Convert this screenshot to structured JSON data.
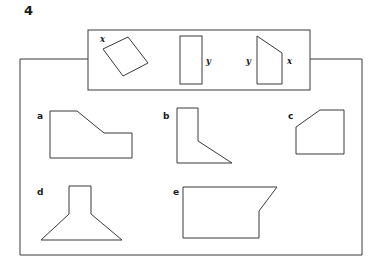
{
  "question": {
    "number": "4"
  },
  "prompt_box": {
    "name": "cross-section-prompt-box",
    "shapes": [
      {
        "id": "rotated-rectangle",
        "label": "x",
        "label_position": "top-left"
      },
      {
        "id": "upright-rectangle",
        "label": "y",
        "label_position": "right"
      },
      {
        "id": "right-trapezoid",
        "labels": [
          "y",
          "x"
        ],
        "label_left": "y",
        "label_right": "x"
      }
    ]
  },
  "answer_shapes": [
    {
      "letter": "a",
      "id": "stepped-diagonal-polygon"
    },
    {
      "letter": "b",
      "id": "vertical-bar-with-triangle"
    },
    {
      "letter": "c",
      "id": "pentagon-cut-corner"
    },
    {
      "letter": "d",
      "id": "funnel-flared-base"
    },
    {
      "letter": "e",
      "id": "rectangle-angled-notch"
    }
  ],
  "style": {
    "stroke_color": "#3a3a3a",
    "text_color": "#1a1a1a",
    "background": "#ffffff"
  }
}
